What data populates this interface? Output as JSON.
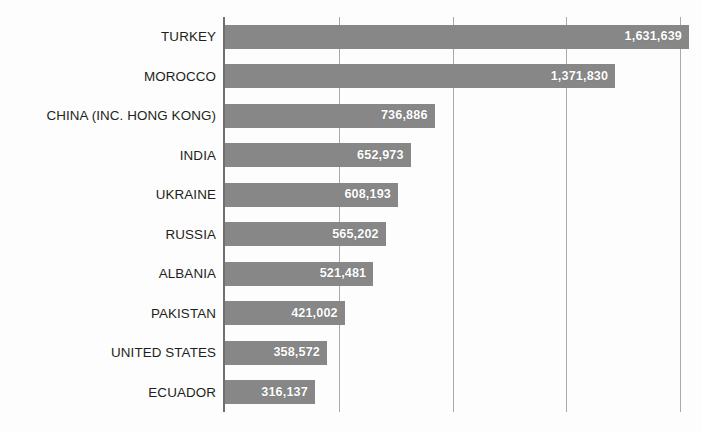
{
  "chart_data": {
    "type": "bar",
    "orientation": "horizontal",
    "title": "",
    "subtitle": "",
    "xlabel": "",
    "ylabel": "",
    "categories": [
      "TURKEY",
      "MOROCCO",
      "CHINA (INC. HONG KONG)",
      "INDIA",
      "UKRAINE",
      "RUSSIA",
      "ALBANIA",
      "PAKISTAN",
      "UNITED STATES",
      "ECUADOR"
    ],
    "values": [
      1631639,
      1371830,
      736886,
      652973,
      608193,
      565202,
      521481,
      421002,
      358572,
      316137
    ],
    "value_labels": [
      "1,631,639",
      "1,371,830",
      "736,886",
      "652,973",
      "608,193",
      "565,202",
      "521,481",
      "421,002",
      "358,572",
      "316,137"
    ],
    "xlim": [
      0,
      1600000
    ],
    "xticks": [
      0,
      400000,
      800000,
      1200000,
      1600000
    ],
    "xtick_labels": [
      "",
      "",
      "",
      "",
      ""
    ],
    "grid": true,
    "grid_axis": "x",
    "legend": false,
    "legend_position": "none",
    "colors": {
      "bar": "#878787",
      "value_label_text": "#ffffff",
      "category_label_text": "#231f20",
      "gridline": "#a9a9a9",
      "axis_line": "#6f6f6f",
      "background": "#fdfdfd"
    }
  }
}
